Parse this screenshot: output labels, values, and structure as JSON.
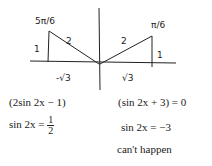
{
  "sketch": {
    "left_triangle": {
      "angle_label": "5π/6",
      "hyp_label": "2",
      "opp_label": "1",
      "adj_label": "-√3"
    },
    "right_triangle": {
      "angle_label": "π/6",
      "hyp_label": "2",
      "opp_label": "1",
      "adj_label": "√3"
    }
  },
  "equations": {
    "left": {
      "factor": "(2sin 2x − 1)",
      "solution_lhs": "sin 2x =",
      "solution_num": "1",
      "solution_den": "2"
    },
    "right": {
      "factor": "(sin 2x + 3) = 0",
      "solution": "sin 2x = −3",
      "note": "can't happen"
    }
  }
}
